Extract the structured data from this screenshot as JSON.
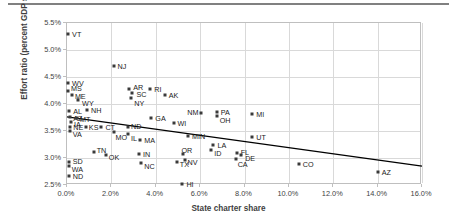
{
  "chart_data": {
    "type": "scatter",
    "title": "",
    "xlabel": "State charter share",
    "ylabel": "Effort ratio (percent GDP state)",
    "xlim": [
      0.0,
      16.0
    ],
    "ylim": [
      2.5,
      5.5
    ],
    "xticks": [
      "0.0%",
      "2.0%",
      "4.0%",
      "6.0%",
      "8.0%",
      "10.0%",
      "12.0%",
      "14.0%",
      "16.0%"
    ],
    "yticks": [
      "2.5%",
      "3.0%",
      "3.5%",
      "4.0%",
      "4.5%",
      "5.0%",
      "5.5%"
    ],
    "xtick_values": [
      0.0,
      2.0,
      4.0,
      6.0,
      8.0,
      10.0,
      12.0,
      14.0,
      16.0
    ],
    "ytick_values": [
      2.5,
      3.0,
      3.5,
      4.0,
      4.5,
      5.0,
      5.5
    ],
    "grid": true,
    "legend": "none",
    "point_color": "#3a3a3a",
    "trendline": {
      "label": "linear-trendline",
      "color": "#000000",
      "x_start": 0.0,
      "y_start": 3.76,
      "x_end": 16.0,
      "y_end": 2.85
    },
    "points": [
      {
        "label": "VT",
        "x": 0.05,
        "y": 5.3,
        "lx": 4,
        "ly": 0
      },
      {
        "label": "NJ",
        "x": 2.1,
        "y": 4.7,
        "lx": 4,
        "ly": 0
      },
      {
        "label": "WV",
        "x": 0.05,
        "y": 4.38,
        "lx": 4,
        "ly": 0
      },
      {
        "label": "MS",
        "x": 0.05,
        "y": 4.24,
        "lx": 3,
        "ly": -3
      },
      {
        "label": "ME",
        "x": 0.22,
        "y": 4.17,
        "lx": 3,
        "ly": 1
      },
      {
        "label": "WY",
        "x": 0.5,
        "y": 4.07,
        "lx": 4,
        "ly": 3
      },
      {
        "label": "AR",
        "x": 2.8,
        "y": 4.27,
        "lx": 4,
        "ly": -2
      },
      {
        "label": "SC",
        "x": 2.95,
        "y": 4.21,
        "lx": 4,
        "ly": 1
      },
      {
        "label": "NY",
        "x": 2.9,
        "y": 4.12,
        "lx": 3,
        "ly": 5
      },
      {
        "label": "RI",
        "x": 3.75,
        "y": 4.28,
        "lx": 4,
        "ly": 0
      },
      {
        "label": "AK",
        "x": 4.4,
        "y": 4.16,
        "lx": 4,
        "ly": 0
      },
      {
        "label": "AL",
        "x": 0.1,
        "y": 3.87,
        "lx": 4,
        "ly": 0
      },
      {
        "label": "NH",
        "x": 0.9,
        "y": 3.88,
        "lx": 4,
        "ly": 0
      },
      {
        "label": "AZ2",
        "x": 0.15,
        "y": 3.76,
        "lx": 3,
        "ly": 1
      },
      {
        "label": "MT",
        "x": 0.45,
        "y": 3.75,
        "lx": 3,
        "ly": 1
      },
      {
        "label": "IA",
        "x": 0.18,
        "y": 3.66,
        "lx": 3,
        "ly": 2
      },
      {
        "label": "NE",
        "x": 0.15,
        "y": 3.58,
        "lx": 3,
        "ly": 0
      },
      {
        "label": "VA",
        "x": 0.12,
        "y": 3.5,
        "lx": 3,
        "ly": 3
      },
      {
        "label": "KS",
        "x": 0.85,
        "y": 3.58,
        "lx": 3,
        "ly": 0
      },
      {
        "label": "CT",
        "x": 1.55,
        "y": 3.58,
        "lx": 4,
        "ly": 0
      },
      {
        "label": "ND2",
        "x": 2.75,
        "y": 3.57,
        "lx": 3,
        "ly": -1
      },
      {
        "label": "MO",
        "x": 2.1,
        "y": 3.48,
        "lx": 2,
        "ly": 5
      },
      {
        "label": "IL",
        "x": 2.75,
        "y": 3.45,
        "lx": 3,
        "ly": 4
      },
      {
        "label": "MA",
        "x": 3.3,
        "y": 3.34,
        "lx": 4,
        "ly": 0
      },
      {
        "label": "GA",
        "x": 3.8,
        "y": 3.74,
        "lx": 4,
        "ly": 0
      },
      {
        "label": "WI",
        "x": 4.8,
        "y": 3.65,
        "lx": 4,
        "ly": 0
      },
      {
        "label": "MIN",
        "x": 5.45,
        "y": 3.4,
        "lx": 4,
        "ly": 0
      },
      {
        "label": "NM",
        "x": 6.05,
        "y": 3.84,
        "lx": -14,
        "ly": -1
      },
      {
        "label": "PA",
        "x": 6.75,
        "y": 3.86,
        "lx": 4,
        "ly": 0
      },
      {
        "label": "OH",
        "x": 6.75,
        "y": 3.77,
        "lx": 3,
        "ly": 4
      },
      {
        "label": "MI",
        "x": 8.35,
        "y": 3.81,
        "lx": 4,
        "ly": 0
      },
      {
        "label": "UT",
        "x": 8.35,
        "y": 3.38,
        "lx": 4,
        "ly": 0
      },
      {
        "label": "LA",
        "x": 6.6,
        "y": 3.25,
        "lx": 4,
        "ly": 0
      },
      {
        "label": "ID",
        "x": 6.5,
        "y": 3.14,
        "lx": 3,
        "ly": 3
      },
      {
        "label": "FL",
        "x": 7.65,
        "y": 3.1,
        "lx": 4,
        "ly": -1
      },
      {
        "label": "DE",
        "x": 7.85,
        "y": 3.05,
        "lx": 4,
        "ly": 3
      },
      {
        "label": "CA",
        "x": 7.6,
        "y": 2.98,
        "lx": 2,
        "ly": 5
      },
      {
        "label": "CO",
        "x": 10.45,
        "y": 2.88,
        "lx": 4,
        "ly": 0
      },
      {
        "label": "AZ",
        "x": 14.0,
        "y": 2.75,
        "lx": 4,
        "ly": 0
      },
      {
        "label": "TN",
        "x": 1.2,
        "y": 3.11,
        "lx": 3,
        "ly": -2
      },
      {
        "label": "OK",
        "x": 1.75,
        "y": 3.06,
        "lx": 3,
        "ly": 2
      },
      {
        "label": "IN",
        "x": 3.25,
        "y": 3.08,
        "lx": 4,
        "ly": 0
      },
      {
        "label": "NC",
        "x": 3.35,
        "y": 2.91,
        "lx": 3,
        "ly": 3
      },
      {
        "label": "TX",
        "x": 4.95,
        "y": 2.93,
        "lx": 3,
        "ly": 2
      },
      {
        "label": "OR",
        "x": 5.25,
        "y": 3.07,
        "lx": -2,
        "ly": -4
      },
      {
        "label": "NV",
        "x": 5.3,
        "y": 2.97,
        "lx": 3,
        "ly": 2
      },
      {
        "label": "SD",
        "x": 0.08,
        "y": 2.93,
        "lx": 4,
        "ly": -1
      },
      {
        "label": "WA",
        "x": 0.08,
        "y": 2.86,
        "lx": 3,
        "ly": 3
      },
      {
        "label": "ND",
        "x": 0.08,
        "y": 2.66,
        "lx": 4,
        "ly": 0
      },
      {
        "label": "HI",
        "x": 5.2,
        "y": 2.51,
        "lx": 4,
        "ly": 0
      }
    ]
  }
}
